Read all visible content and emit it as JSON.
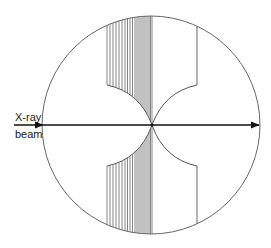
{
  "labels": {
    "beam_top": "X-ray",
    "beam_bottom": "beam"
  },
  "geometry": {
    "circle": {
      "cx": 151,
      "cy": 125,
      "r": 109
    },
    "beam_y": 125,
    "beam_x_start": 14,
    "beam_x_end": 258,
    "center_x": 152,
    "left_boundary_x": 107,
    "right_boundary_x": 197,
    "curve_top_y": 85,
    "curve_bottom_y": 166
  },
  "hatch_lines_x": [
    107,
    110,
    113,
    116,
    119,
    122,
    125,
    127.5,
    130,
    132.5,
    135,
    137,
    139,
    141,
    143,
    145,
    147,
    149,
    150.5,
    152
  ],
  "colors": {
    "stroke": "#555555",
    "beam": "#111111"
  }
}
